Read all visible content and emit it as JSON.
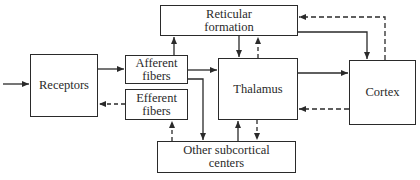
{
  "diagram": {
    "type": "block-diagram",
    "nodes": {
      "receptors": {
        "label": "Receptors"
      },
      "afferent": {
        "label": "Afferent\nfibers"
      },
      "efferent": {
        "label": "Efferent\nfibers"
      },
      "reticular": {
        "label": "Reticular\nformation"
      },
      "thalamus": {
        "label": "Thalamus"
      },
      "cortex": {
        "label": "Cortex"
      },
      "subcortical": {
        "label": "Other subcortical\ncenters"
      }
    },
    "edges": [
      {
        "from": "input",
        "to": "receptors",
        "style": "solid"
      },
      {
        "from": "receptors",
        "to": "afferent",
        "style": "solid"
      },
      {
        "from": "efferent",
        "to": "receptors",
        "style": "dashed"
      },
      {
        "from": "afferent",
        "to": "reticular",
        "style": "solid"
      },
      {
        "from": "afferent",
        "to": "thalamus",
        "style": "solid"
      },
      {
        "from": "afferent",
        "to": "subcortical",
        "style": "solid"
      },
      {
        "from": "subcortical",
        "to": "efferent",
        "style": "dashed"
      },
      {
        "from": "reticular",
        "to": "thalamus",
        "style": "solid"
      },
      {
        "from": "thalamus",
        "to": "reticular",
        "style": "dashed"
      },
      {
        "from": "reticular",
        "to": "cortex",
        "style": "solid"
      },
      {
        "from": "cortex",
        "to": "reticular",
        "style": "dashed"
      },
      {
        "from": "thalamus",
        "to": "cortex",
        "style": "solid"
      },
      {
        "from": "cortex",
        "to": "thalamus",
        "style": "dashed"
      },
      {
        "from": "subcortical",
        "to": "thalamus",
        "style": "solid"
      },
      {
        "from": "thalamus",
        "to": "subcortical",
        "style": "dashed"
      }
    ],
    "colors": {
      "line": "#2a2a2a",
      "background": "#ffffff"
    }
  }
}
